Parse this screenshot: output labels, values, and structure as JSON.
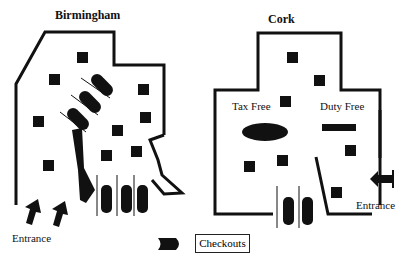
{
  "diagrams": [
    {
      "title": "Birmingham",
      "entrance_label": "Entrance"
    },
    {
      "title": "Cork",
      "zones": [
        "Tax Free",
        "Duty Free"
      ],
      "entrance_label": "Entrance"
    }
  ],
  "legend": {
    "icon": "checkout-icon",
    "label": "Checkouts"
  },
  "colors": {
    "ink": "#111111",
    "background": "#ffffff"
  }
}
